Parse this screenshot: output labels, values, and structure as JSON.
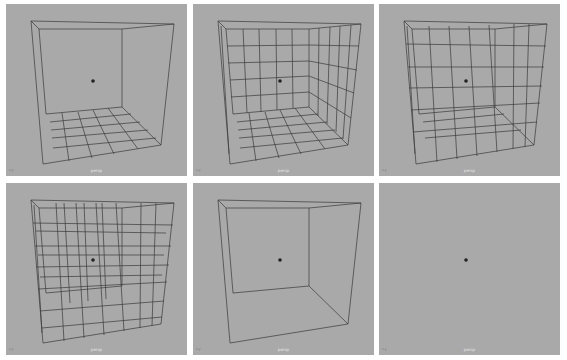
{
  "viewports": [
    {
      "id": "v1",
      "camera_label": "persp",
      "axis_label": "x.y",
      "subdivisions": "floor-grid"
    },
    {
      "id": "v2",
      "camera_label": "persp",
      "axis_label": "x.y",
      "subdivisions": "walls-floor-grid"
    },
    {
      "id": "v3",
      "camera_label": "persp",
      "axis_label": "x.y",
      "subdivisions": "walls-floor-grid"
    },
    {
      "id": "v4",
      "camera_label": "persp",
      "axis_label": "x.y",
      "subdivisions": "volume-grid"
    },
    {
      "id": "v5",
      "camera_label": "persp",
      "axis_label": "x.y",
      "subdivisions": "box-only"
    },
    {
      "id": "v6",
      "camera_label": "persp",
      "axis_label": "x.y",
      "subdivisions": "empty"
    }
  ],
  "colors": {
    "viewport_bg": "#a9a9a9",
    "wire": "#3a3a3a",
    "border": "#ffffff"
  }
}
